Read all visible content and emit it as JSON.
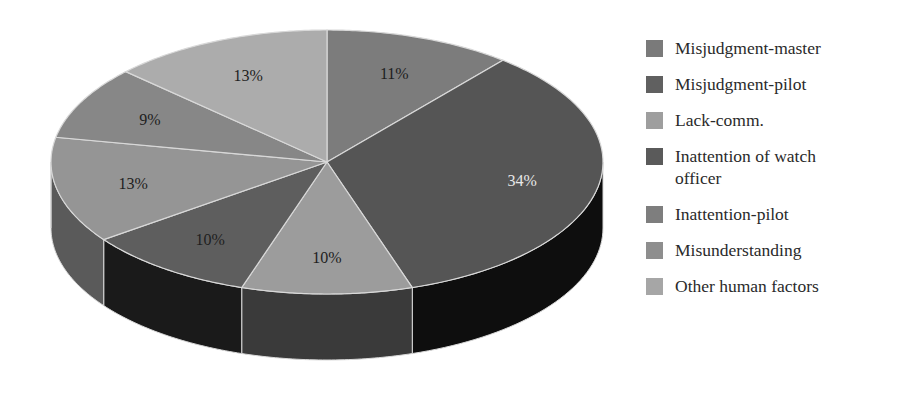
{
  "chart_data": {
    "type": "pie",
    "style": "3d",
    "title": "",
    "start_angle_deg": 0,
    "direction": "clockwise",
    "categories": [
      "Misjudgment-master",
      "Misjudgment-pilot",
      "Lack-comm.",
      "Inattention of watch officer",
      "Inattention-pilot",
      "Misunderstanding",
      "Other human factors"
    ],
    "values": [
      11,
      34,
      10,
      10,
      13,
      9,
      13
    ],
    "data_labels": [
      "11%",
      "34%",
      "10%",
      "10%",
      "13%",
      "9%",
      "13%"
    ],
    "legend_position": "right"
  },
  "slices": [
    {
      "label": "Misjudgment-master",
      "value": 11,
      "pct_label": "11%",
      "top": "#7c7c7c",
      "side": "#4e4e4e",
      "text": "#1e1e1e"
    },
    {
      "label": "Misjudgment-pilot",
      "value": 34,
      "pct_label": "34%",
      "top": "#555555",
      "side": "#0e0e0e",
      "text": "#e8e8e8"
    },
    {
      "label": "Lack-comm.",
      "value": 10,
      "pct_label": "10%",
      "top": "#9c9c9c",
      "side": "#3a3a3a",
      "text": "#1e1e1e"
    },
    {
      "label": "Inattention of watch officer",
      "value": 10,
      "pct_label": "10%",
      "top": "#5e5e5e",
      "side": "#1a1a1a",
      "text": "#1e1e1e"
    },
    {
      "label": "Inattention-pilot",
      "value": 13,
      "pct_label": "13%",
      "top": "#959595",
      "side": "#5a5a5a",
      "text": "#1e1e1e"
    },
    {
      "label": "Misunderstanding",
      "value": 9,
      "pct_label": "9%",
      "top": "#878787",
      "side": "#555555",
      "text": "#1e1e1e"
    },
    {
      "label": "Other human factors",
      "value": 13,
      "pct_label": "13%",
      "top": "#acacac",
      "side": "#6e6e6e",
      "text": "#1e1e1e"
    }
  ],
  "legend": {
    "items": [
      {
        "label": "Misjudgment-master",
        "color": "#7a7a7a"
      },
      {
        "label": "Misjudgment-pilot",
        "color": "#606060"
      },
      {
        "label": "Lack-comm.",
        "color": "#9e9e9e"
      },
      {
        "label": "Inattention of watch officer",
        "color": "#5a5a5a"
      },
      {
        "label": "Inattention-pilot",
        "color": "#7e7e7e"
      },
      {
        "label": "Misunderstanding",
        "color": "#8e8e8e"
      },
      {
        "label": "Other human factors",
        "color": "#a6a6a6"
      }
    ]
  }
}
